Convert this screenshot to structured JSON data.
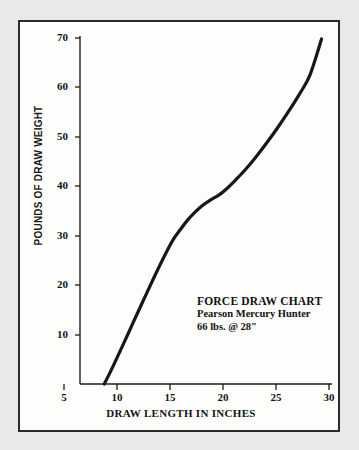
{
  "chart_data": {
    "type": "line",
    "title": "FORCE DRAW CHART",
    "subtitle": "Pearson Mercury Hunter",
    "note": "66 lbs. @ 28\"",
    "xlabel": "DRAW LENGTH IN INCHES",
    "ylabel": "POUNDS OF DRAW WEIGHT",
    "xlim": [
      5,
      30.5
    ],
    "ylim": [
      0,
      70
    ],
    "grid": false,
    "legend": false,
    "xticks": [
      5,
      10,
      15,
      20,
      25,
      30
    ],
    "xtick_labels": [
      "5",
      "10",
      "15",
      "20",
      "25",
      "30"
    ],
    "yticks": [
      10,
      20,
      30,
      40,
      50,
      60,
      70
    ],
    "ytick_labels": [
      "10",
      "20",
      "30",
      "40",
      "50",
      "60",
      "70"
    ],
    "line_color": "#171717",
    "series": [
      {
        "name": "Draw force curve",
        "x": [
          8.8,
          9.5,
          10.5,
          11.5,
          12.5,
          13.5,
          14.5,
          15.3,
          16.0,
          16.6,
          17.2,
          18.0,
          18.8,
          19.6,
          20.4,
          21.2,
          22.2,
          23.2,
          24.2,
          25.2,
          26.2,
          27.2,
          28.2,
          29.3
        ],
        "y": [
          0.0,
          3.0,
          7.6,
          12.3,
          17.0,
          21.6,
          26.0,
          29.2,
          31.3,
          33.0,
          34.4,
          36.0,
          37.2,
          38.2,
          39.6,
          41.3,
          43.6,
          46.2,
          49.0,
          52.0,
          55.2,
          58.6,
          62.5,
          69.8
        ]
      }
    ]
  },
  "axes": {
    "y_title": "POUNDS OF DRAW WEIGHT",
    "x_title": "DRAW LENGTH IN INCHES"
  },
  "annotation": {
    "title": "FORCE DRAW CHART",
    "model": "Pearson Mercury Hunter",
    "spec": "66 lbs. @ 28\""
  },
  "ticks": {
    "y": [
      "70",
      "60",
      "50",
      "40",
      "30",
      "20",
      "10"
    ],
    "x": [
      "5",
      "10",
      "15",
      "20",
      "25",
      "30"
    ]
  }
}
